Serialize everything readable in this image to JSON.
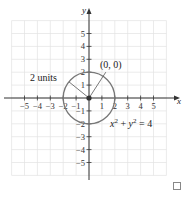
{
  "chart_data": {
    "type": "scatter",
    "title": "",
    "xlabel": "x",
    "ylabel": "y",
    "xlim": [
      -6,
      6
    ],
    "ylim": [
      -6,
      6
    ],
    "grid": true,
    "x_ticks": [
      -5,
      -4,
      -3,
      -2,
      -1,
      1,
      2,
      3,
      4,
      5
    ],
    "y_ticks": [
      5,
      4,
      3,
      2,
      1,
      -1,
      -2,
      -3,
      -4,
      -5
    ],
    "x_tick_labels": [
      "−5",
      "−4",
      "−3",
      "−2",
      "−1",
      "1",
      "2",
      "3",
      "4",
      "5"
    ],
    "y_tick_labels": [
      "5",
      "4",
      "3",
      "2",
      "1",
      "−1",
      "−2",
      "−3",
      "−4",
      "−5"
    ],
    "circle": {
      "center": [
        0,
        0
      ],
      "radius": 2,
      "equation": "x^2 + y^2 = 4"
    },
    "points": [
      {
        "x": 0,
        "y": 0,
        "label": "(0, 0)"
      }
    ],
    "annotations": [
      {
        "text": "2 units",
        "target": "radius"
      },
      {
        "text": "(0, 0)",
        "target": "center"
      },
      {
        "text": "x² + y² = 4",
        "target": "circle"
      }
    ]
  },
  "labels": {
    "x_axis": "x",
    "y_axis": "y",
    "radius_annotation": "2 units",
    "center_annotation": "(0, 0)",
    "equation_x": "x",
    "equation_y": "y",
    "equation_exp": "2",
    "equation_plus": " + ",
    "equation_rhs": " = 4"
  },
  "colors": {
    "grid": "#e2e2e2",
    "axis": "#333333",
    "circle": "#777777",
    "center_point": "#333333"
  }
}
